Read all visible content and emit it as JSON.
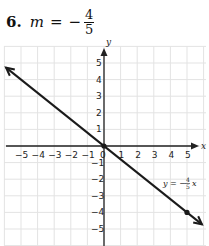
{
  "problem": {
    "number": "6.",
    "variable": "m",
    "equals": "=",
    "sign": "−",
    "numerator": "4",
    "denominator": "5"
  },
  "chart_data": {
    "type": "line",
    "title": "",
    "xlabel": "x",
    "ylabel": "y",
    "xlim": [
      -6,
      6
    ],
    "ylim": [
      -6,
      6
    ],
    "grid": true,
    "x_ticks": [
      "−5",
      "−4",
      "−3",
      "−2",
      "−1",
      "0",
      "1",
      "2",
      "3",
      "4",
      "5"
    ],
    "y_ticks": [
      "5",
      "4",
      "3",
      "2",
      "1",
      "−1",
      "−2",
      "−3",
      "−4",
      "−5"
    ],
    "series": [
      {
        "name": "y = −4/5 x",
        "slope": -0.8,
        "intercept": 0,
        "x": [
          -6,
          0,
          5,
          6
        ],
        "y": [
          4.8,
          0,
          -4,
          -4.8
        ],
        "marked_points": [
          [
            0,
            0
          ],
          [
            5,
            -4
          ]
        ],
        "color": "#1a1a1a"
      }
    ],
    "annotations": [
      {
        "text": "y = −4/5 x",
        "x": 4.8,
        "y": -2.3
      }
    ]
  },
  "labels": {
    "x_axis": "x",
    "y_axis": "y",
    "equation_prefix": "y = −",
    "eq_num": "4",
    "eq_den": "5",
    "eq_suffix": "x"
  }
}
